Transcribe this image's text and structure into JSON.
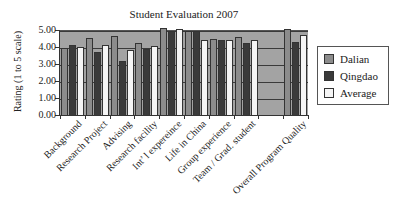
{
  "chart_data": {
    "type": "bar",
    "title": "Student Evaluation 2007",
    "xlabel": "",
    "ylabel": "Rating (1 to 5 scale)",
    "ylim": [
      0,
      5
    ],
    "yticks": [
      "0.00",
      "1.00",
      "2.00",
      "3.00",
      "4.00",
      "5.00"
    ],
    "grid": true,
    "legend_position": "right",
    "categories": [
      "Background",
      "Research Project",
      "Advising",
      "Research facility",
      "Int’ l expereince",
      "Life in China",
      "Group experience",
      "Team / Grad. student",
      "",
      "Overall Program Quality"
    ],
    "series": [
      {
        "name": "Dalian",
        "color": "#8c8c8c",
        "values": [
          4.0,
          4.6,
          4.7,
          4.3,
          5.15,
          5.0,
          4.55,
          4.65,
          null,
          5.1
        ]
      },
      {
        "name": "Qingdao",
        "color": "#3a3a3a",
        "values": [
          4.15,
          3.75,
          3.25,
          3.95,
          5.0,
          5.0,
          4.5,
          4.3,
          null,
          4.35
        ]
      },
      {
        "name": "Average",
        "color": "#f5f5f5",
        "values": [
          4.05,
          4.2,
          3.9,
          4.1,
          5.1,
          4.5,
          4.5,
          4.5,
          null,
          4.75
        ]
      }
    ]
  }
}
